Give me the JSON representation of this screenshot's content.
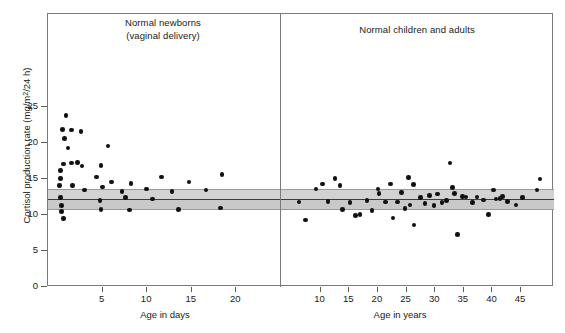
{
  "axes": {
    "ylabel_text": "Cortisol production rate (mg/m",
    "ylabel_sup": "2",
    "ylabel_tail": "/24 h)",
    "ylabel_full": "Cortisol production rate (mg/m2/24 h)",
    "y_ticks": [
      0,
      5,
      10,
      15,
      20,
      25
    ],
    "y_tick_labels": [
      "0",
      "5",
      "10",
      "15",
      "20",
      "25"
    ],
    "ylim": [
      0,
      27.5
    ],
    "left_xlabel": "Age in days",
    "right_xlabel": "Age in years",
    "left_x_ticks": [
      5,
      10,
      15,
      20
    ],
    "left_x_tick_labels": [
      "5",
      "10",
      "15",
      "20"
    ],
    "right_x_ticks": [
      10,
      15,
      20,
      25,
      30,
      35,
      40,
      45
    ],
    "right_x_tick_labels": [
      "10",
      "15",
      "20",
      "25",
      "30",
      "35",
      "40",
      "45"
    ],
    "left_xlim": [
      0,
      24
    ],
    "right_xlim": [
      5,
      49
    ]
  },
  "panels": {
    "left_title": "Normal newborns\n(vaginal delivery)",
    "right_title": "Normal children and adults"
  },
  "reference_band": {
    "label": "normal adult reference range",
    "upper": 13.6,
    "lower": 10.8,
    "mean": 12.2,
    "fill_color_upper": "#d2d2d2",
    "fill_color_lower": "#c9c9c9",
    "mean_line_color": "#3c3c3c"
  },
  "style": {
    "marker_color": "#111111",
    "frame_color": "#7a7a7a",
    "background": "#ffffff"
  },
  "chart_data": {
    "type": "scatter",
    "title": "",
    "ylabel": "Cortisol production rate (mg/m2/24 h)",
    "ylim": [
      0,
      27.5
    ],
    "grid": false,
    "legend": "none",
    "panels": [
      {
        "name": "Normal newborns (vaginal delivery)",
        "xlabel": "Age in days",
        "xlim": [
          0,
          24
        ],
        "points": [
          {
            "x": 0.9,
            "y": 23.8
          },
          {
            "x": 0.5,
            "y": 21.9
          },
          {
            "x": 1.5,
            "y": 21.8
          },
          {
            "x": 2.6,
            "y": 21.6
          },
          {
            "x": 0.7,
            "y": 20.6
          },
          {
            "x": 1.1,
            "y": 19.3
          },
          {
            "x": 5.6,
            "y": 19.6
          },
          {
            "x": 0.6,
            "y": 17.1
          },
          {
            "x": 1.5,
            "y": 17.2
          },
          {
            "x": 2.2,
            "y": 17.3
          },
          {
            "x": 2.7,
            "y": 16.8
          },
          {
            "x": 4.8,
            "y": 16.9
          },
          {
            "x": 0.3,
            "y": 16.2
          },
          {
            "x": 0.3,
            "y": 15.1
          },
          {
            "x": 4.3,
            "y": 15.3
          },
          {
            "x": 6.0,
            "y": 14.6
          },
          {
            "x": 8.2,
            "y": 14.4
          },
          {
            "x": 11.6,
            "y": 15.3
          },
          {
            "x": 14.7,
            "y": 14.6
          },
          {
            "x": 18.4,
            "y": 15.6
          },
          {
            "x": 0.2,
            "y": 14.1
          },
          {
            "x": 1.6,
            "y": 14.1
          },
          {
            "x": 3.0,
            "y": 13.5
          },
          {
            "x": 5.0,
            "y": 13.9
          },
          {
            "x": 7.2,
            "y": 13.3
          },
          {
            "x": 9.9,
            "y": 13.6
          },
          {
            "x": 12.8,
            "y": 13.3
          },
          {
            "x": 16.6,
            "y": 13.5
          },
          {
            "x": 0.3,
            "y": 12.4
          },
          {
            "x": 0.4,
            "y": 11.3
          },
          {
            "x": 4.7,
            "y": 12.0
          },
          {
            "x": 7.6,
            "y": 12.4
          },
          {
            "x": 10.6,
            "y": 12.2
          },
          {
            "x": 0.4,
            "y": 10.5
          },
          {
            "x": 4.8,
            "y": 10.8
          },
          {
            "x": 8.0,
            "y": 10.7
          },
          {
            "x": 13.5,
            "y": 10.8
          },
          {
            "x": 18.2,
            "y": 11.0
          },
          {
            "x": 0.6,
            "y": 9.5
          }
        ]
      },
      {
        "name": "Normal children and adults",
        "xlabel": "Age in years",
        "xlim": [
          5,
          49
        ],
        "points": [
          {
            "x": 6.2,
            "y": 11.8
          },
          {
            "x": 7.4,
            "y": 9.3
          },
          {
            "x": 9.2,
            "y": 13.6
          },
          {
            "x": 10.3,
            "y": 14.3
          },
          {
            "x": 11.3,
            "y": 11.9
          },
          {
            "x": 12.5,
            "y": 15.1
          },
          {
            "x": 13.4,
            "y": 14.1
          },
          {
            "x": 13.8,
            "y": 10.8
          },
          {
            "x": 15.1,
            "y": 11.7
          },
          {
            "x": 16.1,
            "y": 9.9
          },
          {
            "x": 16.9,
            "y": 10.1
          },
          {
            "x": 18.1,
            "y": 12.0
          },
          {
            "x": 19.0,
            "y": 10.6
          },
          {
            "x": 20.0,
            "y": 13.6
          },
          {
            "x": 20.2,
            "y": 13.0
          },
          {
            "x": 21.3,
            "y": 11.8
          },
          {
            "x": 22.2,
            "y": 14.3
          },
          {
            "x": 22.6,
            "y": 9.6
          },
          {
            "x": 23.4,
            "y": 11.8
          },
          {
            "x": 24.1,
            "y": 13.1
          },
          {
            "x": 24.7,
            "y": 10.9
          },
          {
            "x": 25.3,
            "y": 15.2
          },
          {
            "x": 25.6,
            "y": 11.4
          },
          {
            "x": 26.2,
            "y": 14.2
          },
          {
            "x": 26.3,
            "y": 8.6
          },
          {
            "x": 27.4,
            "y": 12.4
          },
          {
            "x": 28.2,
            "y": 11.6
          },
          {
            "x": 29.0,
            "y": 12.7
          },
          {
            "x": 29.8,
            "y": 11.3
          },
          {
            "x": 30.4,
            "y": 12.9
          },
          {
            "x": 31.2,
            "y": 11.7
          },
          {
            "x": 32.0,
            "y": 12.0
          },
          {
            "x": 32.6,
            "y": 17.2
          },
          {
            "x": 33.0,
            "y": 13.8
          },
          {
            "x": 33.4,
            "y": 13.0
          },
          {
            "x": 33.9,
            "y": 7.3
          },
          {
            "x": 34.8,
            "y": 12.6
          },
          {
            "x": 35.4,
            "y": 12.5
          },
          {
            "x": 36.5,
            "y": 11.7
          },
          {
            "x": 37.3,
            "y": 12.5
          },
          {
            "x": 38.4,
            "y": 12.1
          },
          {
            "x": 39.3,
            "y": 10.1
          },
          {
            "x": 40.2,
            "y": 13.5
          },
          {
            "x": 40.6,
            "y": 12.2
          },
          {
            "x": 41.3,
            "y": 12.3
          },
          {
            "x": 41.8,
            "y": 12.6
          },
          {
            "x": 42.6,
            "y": 11.9
          },
          {
            "x": 44.1,
            "y": 11.4
          },
          {
            "x": 45.2,
            "y": 12.4
          },
          {
            "x": 47.8,
            "y": 13.5
          },
          {
            "x": 48.3,
            "y": 15.0
          }
        ]
      }
    ]
  }
}
